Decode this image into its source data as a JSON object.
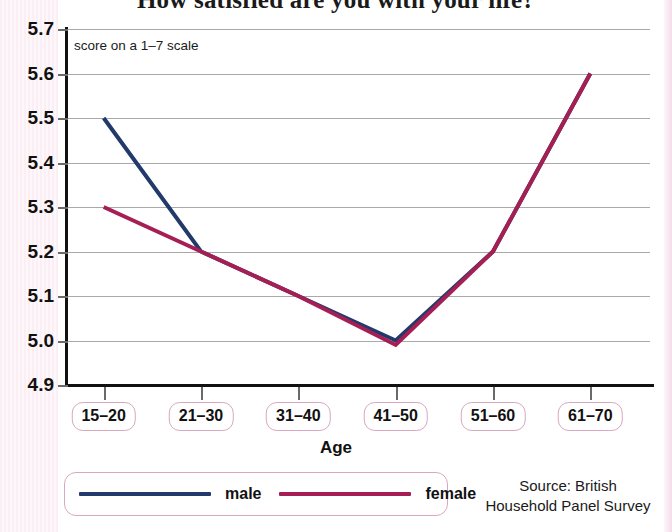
{
  "title": "How satisfied are you with your life?",
  "note": "score on a 1–7 scale",
  "axis_title": "Age",
  "source_line1": "Source: British",
  "source_line2": "Household Panel Survey",
  "legend": {
    "male_label": "male",
    "female_label": "female",
    "male_color": "#223a6b",
    "female_color": "#a61f54"
  },
  "chart_data": {
    "type": "line",
    "title": "How satisfied are you with your life?",
    "xlabel": "Age",
    "ylabel": "",
    "annotation": "score on a 1–7 scale",
    "categories": [
      "15–20",
      "21–30",
      "31–40",
      "41–50",
      "51–60",
      "61–70"
    ],
    "yticks": [
      "5.7",
      "5.6",
      "5.5",
      "5.4",
      "5.3",
      "5.2",
      "5.1",
      "5.0",
      "4.9"
    ],
    "ylim": [
      4.9,
      5.7
    ],
    "grid": true,
    "legend_position": "bottom-left",
    "series": [
      {
        "name": "male",
        "color": "#223a6b",
        "values": [
          5.5,
          5.2,
          5.1,
          5.0,
          5.2,
          5.6
        ]
      },
      {
        "name": "female",
        "color": "#a61f54",
        "values": [
          5.3,
          5.2,
          5.1,
          4.99,
          5.2,
          5.6
        ]
      }
    ],
    "source": "Source: British Household Panel Survey"
  }
}
